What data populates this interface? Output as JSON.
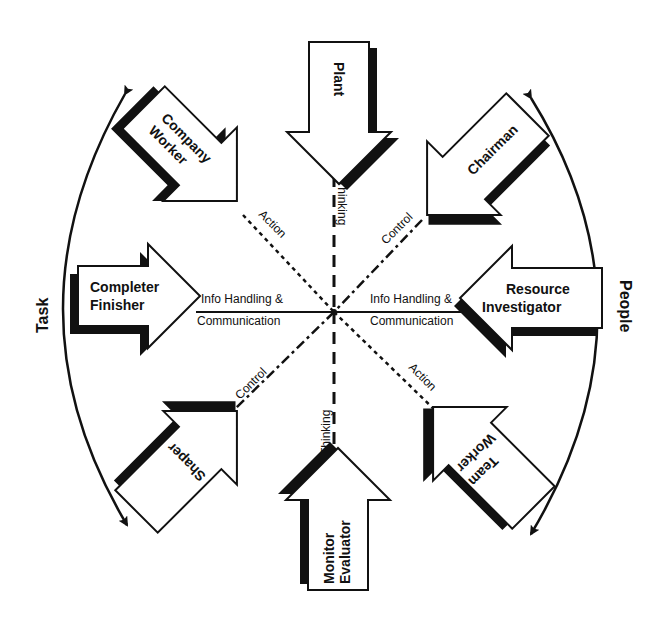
{
  "diagram": {
    "center": {
      "x": 334,
      "y": 312
    },
    "colors": {
      "ink": "#111111",
      "background": "#ffffff"
    },
    "sides": {
      "left": {
        "label": "Task"
      },
      "right": {
        "label": "People"
      }
    },
    "roles": [
      {
        "id": "plant",
        "line1": "Plant",
        "line2": "",
        "position": "top"
      },
      {
        "id": "chairman",
        "line1": "Chairman",
        "line2": "",
        "position": "top-right"
      },
      {
        "id": "resource-investigator",
        "line1": "Resource",
        "line2": "Investigator",
        "position": "right"
      },
      {
        "id": "team-worker",
        "line1": "Team",
        "line2": "Worker",
        "position": "bottom-right"
      },
      {
        "id": "monitor-evaluator",
        "line1": "Monitor",
        "line2": "Evaluator",
        "position": "bottom"
      },
      {
        "id": "shaper",
        "line1": "Shaper",
        "line2": "",
        "position": "bottom-left"
      },
      {
        "id": "completer-finisher",
        "line1": "Completer",
        "line2": "Finisher",
        "position": "left"
      },
      {
        "id": "company-worker",
        "line1": "Company",
        "line2": "Worker",
        "position": "top-left"
      }
    ],
    "axes": [
      {
        "id": "thinking-top",
        "label": "Thinking",
        "style": "dashed"
      },
      {
        "id": "thinking-bottom",
        "label": "Thinking",
        "style": "dashed"
      },
      {
        "id": "control-top-right",
        "label": "Control",
        "style": "dash-dot"
      },
      {
        "id": "control-bottom-left",
        "label": "Control",
        "style": "dash-dot"
      },
      {
        "id": "action-top-left",
        "label": "Action",
        "style": "dotted"
      },
      {
        "id": "action-bottom-right",
        "label": "Action",
        "style": "dotted"
      },
      {
        "id": "info-left",
        "label_line1": "Info Handling &",
        "label_line2": "Communication",
        "style": "solid"
      },
      {
        "id": "info-right",
        "label_line1": "Info Handling &",
        "label_line2": "Communication",
        "style": "solid"
      }
    ]
  }
}
